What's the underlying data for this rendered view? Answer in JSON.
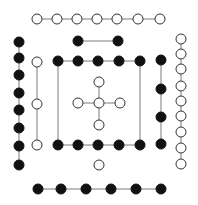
{
  "canvas": {
    "width": 198,
    "height": 205,
    "background": "#ffffff"
  },
  "style": {
    "node_radius": 5,
    "edge_color": "#7a7a7a",
    "open_fill": "#ffffff",
    "open_stroke": "#333333",
    "filled_color": "#111111"
  },
  "groups": [
    {
      "name": "top-open-row",
      "type": "open",
      "nodes": [
        [
          37,
          19
        ],
        [
          57,
          19
        ],
        [
          77,
          19
        ],
        [
          97,
          19
        ],
        [
          117,
          19
        ],
        [
          138,
          19
        ],
        [
          160,
          19
        ]
      ],
      "edges": [
        [
          0,
          1
        ],
        [
          1,
          2
        ],
        [
          2,
          3
        ],
        [
          3,
          4
        ],
        [
          4,
          5
        ],
        [
          5,
          6
        ]
      ]
    },
    {
      "name": "top-filled-pair",
      "type": "filled",
      "nodes": [
        [
          78,
          41
        ],
        [
          118,
          41
        ]
      ],
      "edges": [
        [
          0,
          1
        ]
      ]
    },
    {
      "name": "left-filled-column",
      "type": "filled",
      "nodes": [
        [
          19,
          42
        ],
        [
          19,
          58
        ],
        [
          19,
          75
        ],
        [
          19,
          93
        ],
        [
          19,
          110
        ],
        [
          19,
          128
        ],
        [
          19,
          146
        ],
        [
          19,
          165
        ]
      ],
      "edges": [
        [
          0,
          1
        ],
        [
          1,
          2
        ],
        [
          2,
          3
        ],
        [
          3,
          4
        ],
        [
          4,
          5
        ],
        [
          5,
          6
        ],
        [
          6,
          7
        ]
      ]
    },
    {
      "name": "left-open-column",
      "type": "open",
      "nodes": [
        [
          37,
          62
        ],
        [
          37,
          104
        ],
        [
          37,
          145
        ]
      ],
      "edges": [
        [
          0,
          1
        ],
        [
          1,
          2
        ]
      ]
    },
    {
      "name": "inner-filled-frame",
      "type": "filled",
      "nodes": [
        [
          58,
          61
        ],
        [
          78,
          61
        ],
        [
          98,
          61
        ],
        [
          119,
          61
        ],
        [
          140,
          61
        ],
        [
          58,
          145
        ],
        [
          78,
          145
        ],
        [
          98,
          145
        ],
        [
          119,
          145
        ],
        [
          140,
          145
        ]
      ],
      "edges": [
        [
          0,
          1
        ],
        [
          1,
          2
        ],
        [
          2,
          3
        ],
        [
          3,
          4
        ],
        [
          5,
          6
        ],
        [
          6,
          7
        ],
        [
          7,
          8
        ],
        [
          8,
          9
        ],
        [
          0,
          5
        ],
        [
          4,
          9
        ]
      ]
    },
    {
      "name": "right-filled-column",
      "type": "filled",
      "nodes": [
        [
          161,
          60
        ],
        [
          161,
          89
        ],
        [
          161,
          117
        ],
        [
          161,
          144
        ]
      ],
      "edges": [
        [
          0,
          1
        ],
        [
          1,
          2
        ],
        [
          2,
          3
        ]
      ]
    },
    {
      "name": "center-open-cross",
      "type": "open",
      "nodes": [
        [
          99,
          103
        ],
        [
          99,
          82
        ],
        [
          99,
          125
        ],
        [
          78,
          103
        ],
        [
          120,
          103
        ]
      ],
      "edges": [
        [
          0,
          1
        ],
        [
          0,
          2
        ],
        [
          0,
          3
        ],
        [
          0,
          4
        ]
      ]
    },
    {
      "name": "right-open-column",
      "type": "open",
      "nodes": [
        [
          181,
          39
        ],
        [
          181,
          54
        ],
        [
          181,
          69
        ],
        [
          181,
          86
        ],
        [
          181,
          101
        ],
        [
          181,
          116
        ],
        [
          181,
          132
        ],
        [
          181,
          148
        ],
        [
          181,
          164
        ]
      ],
      "edges": [
        [
          0,
          1
        ],
        [
          1,
          2
        ],
        [
          2,
          3
        ],
        [
          3,
          4
        ],
        [
          4,
          5
        ],
        [
          5,
          6
        ],
        [
          6,
          7
        ],
        [
          7,
          8
        ]
      ]
    },
    {
      "name": "isolated-open-node",
      "type": "open",
      "nodes": [
        [
          99,
          165
        ]
      ],
      "edges": []
    },
    {
      "name": "bottom-filled-row",
      "type": "filled",
      "nodes": [
        [
          38,
          189
        ],
        [
          61,
          189
        ],
        [
          86,
          189
        ],
        [
          111,
          189
        ],
        [
          136,
          189
        ],
        [
          161,
          189
        ]
      ],
      "edges": [
        [
          0,
          1
        ],
        [
          1,
          2
        ],
        [
          2,
          3
        ],
        [
          3,
          4
        ],
        [
          4,
          5
        ]
      ]
    }
  ]
}
